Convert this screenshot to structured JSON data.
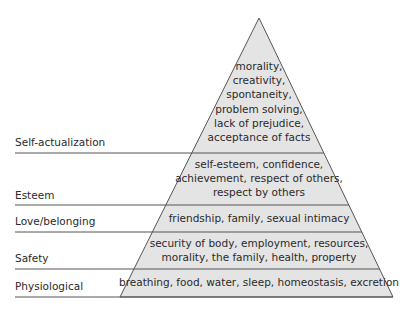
{
  "diagram": {
    "type": "pyramid",
    "colors": {
      "fill": "#e4e4e4",
      "stroke": "#555555",
      "text": "#2a2a2a",
      "background": "#ffffff"
    },
    "levels": [
      {
        "name": "Self-actualization",
        "lines": [
          "morality,",
          "creativity,",
          "spontaneity,",
          "problem solving,",
          "lack of prejudice,",
          "acceptance of facts"
        ]
      },
      {
        "name": "Esteem",
        "lines": [
          "self-esteem, confidence,",
          "achievement, respect of others,",
          "respect by others"
        ]
      },
      {
        "name": "Love/belonging",
        "lines": [
          "friendship, family, sexual intimacy"
        ]
      },
      {
        "name": "Safety",
        "lines": [
          "security of body, employment, resources,",
          "morality, the family, health, property"
        ]
      },
      {
        "name": "Physiological",
        "lines": [
          "breathing, food, water, sleep, homeostasis, excretion"
        ]
      }
    ]
  }
}
